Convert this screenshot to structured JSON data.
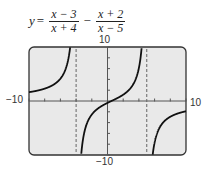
{
  "equation": {
    "lhs": "y",
    "equals": "=",
    "term1": {
      "numerator": "x − 3",
      "denominator": "x + 4"
    },
    "operator": "−",
    "term2": {
      "numerator": "x + 2",
      "denominator": "x − 5"
    }
  },
  "axes": {
    "ymax_label": "10",
    "ymin_label": "−10",
    "xmin_label": "−10",
    "xmax_label": "10"
  },
  "chart_data": {
    "type": "line",
    "xlabel": "",
    "ylabel": "",
    "xlim": [
      -10,
      10
    ],
    "ylim": [
      -10,
      10
    ],
    "grid": false,
    "vertical_asymptotes": [
      -4,
      5
    ],
    "series": [
      {
        "name": "y = (x − 3)/(x + 4) − (x + 2)/(x − 5)",
        "function": "(x-3)/(x+4) - (x+2)/(x-5)"
      }
    ],
    "tick_labels": {
      "x": [
        "−10",
        "10"
      ],
      "y": [
        "−10",
        "10"
      ]
    }
  },
  "colors": {
    "screen": "#e9e9e9",
    "frame": "#333333",
    "curve": "#111111",
    "asymptote": "#666666"
  }
}
